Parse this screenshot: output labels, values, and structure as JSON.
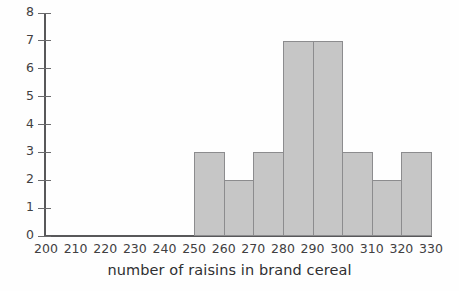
{
  "chart_data": {
    "type": "bar",
    "title": "",
    "subtitle": "",
    "xlabel": "number of raisins in brand cereal",
    "ylabel": "",
    "xlim": [
      200,
      330
    ],
    "ylim": [
      0,
      8
    ],
    "bin_width": 10,
    "grid": false,
    "legend": null,
    "x_tick_labels": [
      "200",
      "210",
      "220",
      "230",
      "240",
      "250",
      "260",
      "270",
      "280",
      "290",
      "300",
      "310",
      "320",
      "330"
    ],
    "x_ticks": [
      200,
      210,
      220,
      230,
      240,
      250,
      260,
      270,
      280,
      290,
      300,
      310,
      320,
      330
    ],
    "y_tick_labels": [
      "0",
      "1",
      "2",
      "3",
      "4",
      "5",
      "6",
      "7",
      "8"
    ],
    "y_ticks": [
      0,
      1,
      2,
      3,
      4,
      5,
      6,
      7,
      8
    ],
    "categories": [
      "250-260",
      "260-270",
      "270-280",
      "280-290",
      "290-300",
      "300-310",
      "310-320",
      "320-330"
    ],
    "bin_starts": [
      250,
      260,
      270,
      280,
      290,
      300,
      310,
      320
    ],
    "bin_ends": [
      260,
      270,
      280,
      290,
      300,
      310,
      320,
      330
    ],
    "values": [
      3,
      2,
      3,
      7,
      7,
      3,
      2,
      3
    ],
    "colors": {
      "bar_fill": "#c6c6c6",
      "bar_stroke": "#8c8c8e",
      "axis": "#58585a",
      "text": "#414042",
      "background": "#fefefe"
    }
  }
}
